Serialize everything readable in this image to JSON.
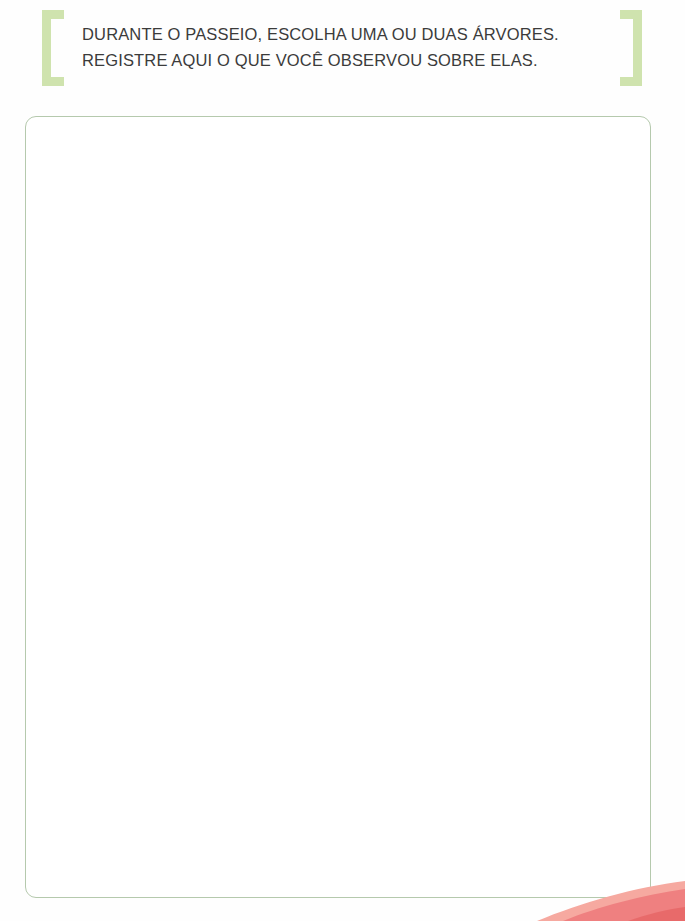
{
  "page": {
    "background_color": "#fefefe",
    "width": 685,
    "height": 921
  },
  "header": {
    "instruction_line_1": "DURANTE O PASSEIO, ESCOLHA UMA OU DUAS ÁRVORES.",
    "instruction_line_2": "REGISTRE AQUI O QUE VOCÊ OBSERVOU SOBRE ELAS.",
    "text_color": "#3b3b3b",
    "bracket_left_icon": "bracket-open-icon",
    "bracket_right_icon": "bracket-close-icon",
    "bracket_color": "#cfe3ae"
  },
  "answer_area": {
    "value": "",
    "placeholder": "",
    "border_color": "#b5c9ad",
    "background_color": "#ffffff"
  },
  "decoration": {
    "corner_wave_icon": "wave-swoosh-icon",
    "wave_color_primary": "#ef8080",
    "wave_color_secondary": "#f6a9a0"
  }
}
